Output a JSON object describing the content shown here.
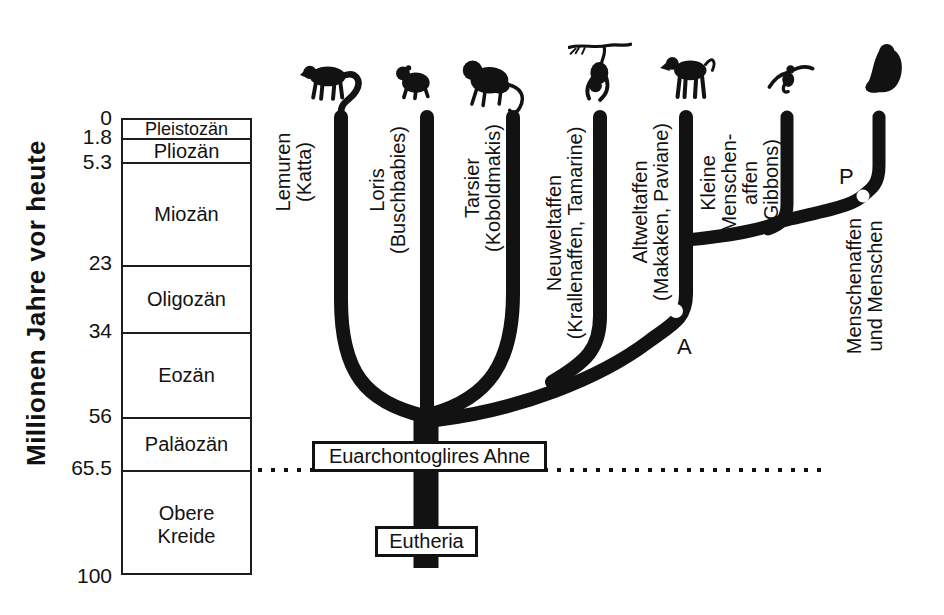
{
  "figure": {
    "axis": {
      "title": "Millionen Jahre vor heute",
      "ticks": [
        "0",
        "1.8",
        "5.3",
        "23",
        "34",
        "56",
        "65.5",
        "100"
      ]
    },
    "epochs": [
      "Pleistozän",
      "Pliozän",
      "Miozän",
      "Oligozän",
      "Eozän",
      "Paläozän",
      "Obere Kreide"
    ],
    "branches": [
      {
        "icon": "lemur-silhouette",
        "lines": [
          "Lemuren",
          "(Katta)"
        ]
      },
      {
        "icon": "loris-silhouette",
        "lines": [
          "Loris",
          "(Buschbabies)"
        ]
      },
      {
        "icon": "tarsier-silhouette",
        "lines": [
          "Tarsier",
          "(Koboldmakis)"
        ]
      },
      {
        "icon": "new-world-monkey-silhouette",
        "lines": [
          "Neuweltaffen",
          "(Krallenaffen, Tamarine)"
        ]
      },
      {
        "icon": "baboon-silhouette",
        "lines": [
          "Altweltaffen",
          "(Makaken, Paviane)"
        ]
      },
      {
        "icon": "gibbon-silhouette",
        "lines": [
          "Kleine",
          "Menschen-",
          "affen",
          "(Gibbons)"
        ]
      },
      {
        "icon": "chimpanzee-silhouette",
        "lines": [
          "Menschenaffen",
          "und Menschen"
        ]
      }
    ],
    "node_labels": {
      "a": "A",
      "p": "P"
    },
    "callouts": {
      "ancestor_box": "Euarchontoglires Ahne",
      "root_box": "Eutheria"
    },
    "colors": {
      "ink": "#121212",
      "background": "#ffffff"
    }
  }
}
